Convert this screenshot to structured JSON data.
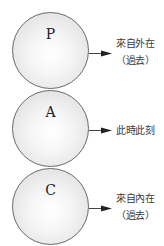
{
  "diagram": {
    "nodes": [
      {
        "letter": "P",
        "label_line1": "來自外在",
        "label_line2": "（過去）"
      },
      {
        "letter": "A",
        "label_line1": "此時此刻",
        "label_line2": ""
      },
      {
        "letter": "C",
        "label_line1": "來自內在",
        "label_line2": "（過去）"
      }
    ],
    "colors": {
      "circle_stroke": "#6a6a6a",
      "circle_fill_center": "#ffffff",
      "circle_fill_edge": "#d4d4d4",
      "arrow": "#222222",
      "text": "#3a3a3a"
    }
  }
}
